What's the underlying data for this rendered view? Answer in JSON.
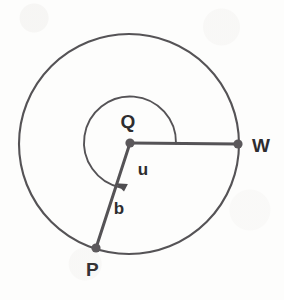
{
  "figure": {
    "background_color": "#fdfdfc",
    "stroke_color": "#555356",
    "label_color": "#2e2d2f",
    "labels": {
      "center": "Q",
      "radius_end_right": "W",
      "radius_end_lower_left": "P",
      "angle": "u",
      "radius_segment": "b"
    },
    "geometry": {
      "circle_center_x": 129,
      "circle_center_y": 144,
      "circle_radius": 110,
      "point_W_x": 238,
      "point_W_y": 144,
      "point_P_x": 96,
      "point_P_y": 248,
      "arc_radius": 46,
      "angle_start_degrees": 0,
      "angle_end_degrees": 252,
      "angle_sweep_direction": "clockwise"
    },
    "label_positions": {
      "Q": {
        "x": 128,
        "y": 128
      },
      "W": {
        "x": 252,
        "y": 152
      },
      "P": {
        "x": 86,
        "y": 276
      },
      "u": {
        "x": 143,
        "y": 175
      },
      "b": {
        "x": 119,
        "y": 214
      }
    }
  }
}
